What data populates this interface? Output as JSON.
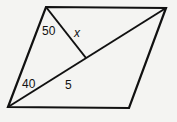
{
  "figure": {
    "type": "parallelogram with diagonal and perpendicular",
    "stroke_color": "#111111",
    "background_color": "#f4f4f2",
    "vertices": {
      "bottom_left": [
        8,
        107
      ],
      "top_left": [
        46,
        7
      ],
      "top_right": [
        166,
        8
      ],
      "bottom_right": [
        129,
        108
      ]
    },
    "perpendicular_foot": [
      86,
      58
    ],
    "labels": {
      "angle_top": "50",
      "segment_x": "x",
      "angle_bottom": "40",
      "segment_5": "5"
    }
  }
}
